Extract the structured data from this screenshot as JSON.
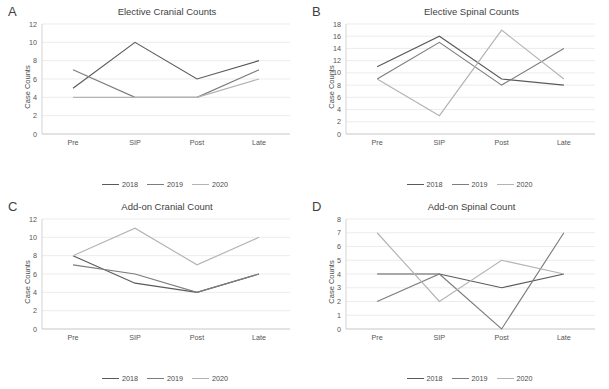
{
  "figure": {
    "x_categories": [
      "Pre",
      "SIP",
      "Post",
      "Late"
    ],
    "y_axis_label": "Case Counts",
    "series_names": [
      "2018",
      "2019",
      "2020"
    ],
    "series_colors": [
      "#5a5a5a",
      "#7d7d7d",
      "#b3b3b3"
    ]
  },
  "panels": [
    {
      "letter": "A",
      "title": "Elective Cranial Counts",
      "ylabel": "Case Counts"
    },
    {
      "letter": "B",
      "title": "Elective Spinal Counts",
      "ylabel": "Case Counts"
    },
    {
      "letter": "C",
      "title": "Add-on Cranial Count",
      "ylabel": "Case Counts"
    },
    {
      "letter": "D",
      "title": "Add-on Spinal Count",
      "ylabel": "Case Counts"
    }
  ],
  "chart_data": [
    {
      "type": "line",
      "panel": "A",
      "title": "Elective Cranial Counts",
      "xlabel": "",
      "ylabel": "Case Counts",
      "categories": [
        "Pre",
        "SIP",
        "Post",
        "Late"
      ],
      "ylim": [
        0,
        12
      ],
      "yticks": [
        0,
        2,
        4,
        6,
        8,
        10,
        12
      ],
      "grid": true,
      "legend_position": "bottom",
      "series": [
        {
          "name": "2018",
          "color": "#5a5a5a",
          "values": [
            5,
            10,
            6,
            8
          ]
        },
        {
          "name": "2019",
          "color": "#7d7d7d",
          "values": [
            7,
            4,
            4,
            7
          ]
        },
        {
          "name": "2020",
          "color": "#b3b3b3",
          "values": [
            4,
            4,
            4,
            6
          ]
        }
      ]
    },
    {
      "type": "line",
      "panel": "B",
      "title": "Elective Spinal Counts",
      "xlabel": "",
      "ylabel": "Case Counts",
      "categories": [
        "Pre",
        "SIP",
        "Post",
        "Late"
      ],
      "ylim": [
        0,
        18
      ],
      "yticks": [
        0,
        2,
        4,
        6,
        8,
        10,
        12,
        14,
        16,
        18
      ],
      "grid": true,
      "legend_position": "bottom",
      "series": [
        {
          "name": "2018",
          "color": "#5a5a5a",
          "values": [
            11,
            16,
            9,
            8
          ]
        },
        {
          "name": "2019",
          "color": "#7d7d7d",
          "values": [
            9,
            15,
            8,
            14
          ]
        },
        {
          "name": "2020",
          "color": "#b3b3b3",
          "values": [
            9,
            3,
            17,
            9
          ]
        }
      ]
    },
    {
      "type": "line",
      "panel": "C",
      "title": "Add-on Cranial Count",
      "xlabel": "",
      "ylabel": "Case Counts",
      "categories": [
        "Pre",
        "SIP",
        "Post",
        "Late"
      ],
      "ylim": [
        0,
        12
      ],
      "yticks": [
        0,
        2,
        4,
        6,
        8,
        10,
        12
      ],
      "grid": true,
      "legend_position": "bottom",
      "series": [
        {
          "name": "2018",
          "color": "#5a5a5a",
          "values": [
            8,
            5,
            4,
            6
          ]
        },
        {
          "name": "2019",
          "color": "#7d7d7d",
          "values": [
            7,
            6,
            4,
            6
          ]
        },
        {
          "name": "2020",
          "color": "#b3b3b3",
          "values": [
            8,
            11,
            7,
            10
          ]
        }
      ]
    },
    {
      "type": "line",
      "panel": "D",
      "title": "Add-on Spinal Count",
      "xlabel": "",
      "ylabel": "Case Counts",
      "categories": [
        "Pre",
        "SIP",
        "Post",
        "Late"
      ],
      "ylim": [
        0,
        8
      ],
      "yticks": [
        0,
        1,
        2,
        3,
        4,
        5,
        6,
        7,
        8
      ],
      "grid": true,
      "legend_position": "bottom",
      "series": [
        {
          "name": "2018",
          "color": "#5a5a5a",
          "values": [
            4,
            4,
            3,
            4
          ]
        },
        {
          "name": "2019",
          "color": "#7d7d7d",
          "values": [
            2,
            4,
            0,
            7
          ]
        },
        {
          "name": "2020",
          "color": "#b3b3b3",
          "values": [
            7,
            2,
            5,
            4
          ]
        }
      ]
    }
  ]
}
